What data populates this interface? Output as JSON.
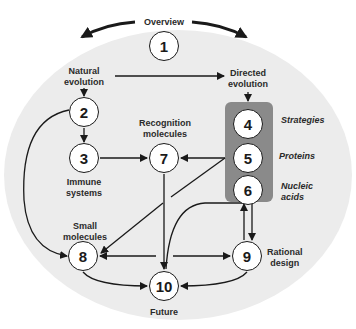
{
  "diagram": {
    "colors": {
      "background_ellipse": "#ececec",
      "highlight_box": "#8a8a8a",
      "stroke": "#1a1a1a"
    },
    "header": "Overview",
    "nodes": [
      {
        "id": "1",
        "label": "1"
      },
      {
        "id": "2",
        "label": "2"
      },
      {
        "id": "3",
        "label": "3"
      },
      {
        "id": "4",
        "label": "4"
      },
      {
        "id": "5",
        "label": "5"
      },
      {
        "id": "6",
        "label": "6"
      },
      {
        "id": "7",
        "label": "7"
      },
      {
        "id": "8",
        "label": "8"
      },
      {
        "id": "9",
        "label": "9"
      },
      {
        "id": "10",
        "label": "10"
      }
    ],
    "labels": {
      "natural_evolution_1": "Natural",
      "natural_evolution_2": "evolution",
      "directed_evolution_1": "Directed",
      "directed_evolution_2": "evolution",
      "recognition_1": "Recognition",
      "recognition_2": "molecules",
      "immune_1": "Immune",
      "immune_2": "systems",
      "small_1": "Small",
      "small_2": "molecules",
      "strategies": "Strategies",
      "proteins": "Proteins",
      "nucleic_1": "Nucleic",
      "nucleic_2": "acids",
      "rational_1": "Rational",
      "rational_2": "design",
      "future": "Future"
    },
    "edges": [
      {
        "from": "Overview",
        "to": "Natural evolution"
      },
      {
        "from": "Overview",
        "to": "Directed evolution"
      },
      {
        "from": "Natural evolution",
        "to": "Directed evolution"
      },
      {
        "from": "Natural evolution",
        "to": "2"
      },
      {
        "from": "Directed evolution",
        "to": "4"
      },
      {
        "from": "2",
        "to": "3"
      },
      {
        "from": "2",
        "to": "8"
      },
      {
        "from": "3",
        "to": "7"
      },
      {
        "from": "5",
        "to": "7"
      },
      {
        "from": "5",
        "to": "8"
      },
      {
        "from": "7",
        "to": "10"
      },
      {
        "from": "6",
        "to": "9"
      },
      {
        "from": "9",
        "to": "6"
      },
      {
        "from": "6",
        "to": "10"
      },
      {
        "from": "10",
        "to": "8"
      },
      {
        "from": "10",
        "to": "9"
      },
      {
        "from": "8",
        "to": "10"
      },
      {
        "from": "9",
        "to": "10"
      }
    ]
  }
}
